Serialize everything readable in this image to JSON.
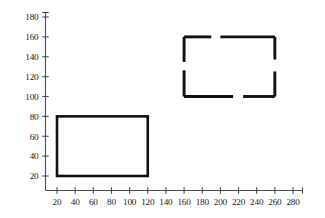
{
  "chart_data": {
    "type": "scatter",
    "title": "",
    "xlabel": "",
    "ylabel": "",
    "xlim": [
      0,
      290
    ],
    "ylim": [
      0,
      190
    ],
    "grid": false,
    "legend": null,
    "x_ticks": [
      20,
      40,
      60,
      80,
      100,
      120,
      140,
      160,
      180,
      200,
      220,
      240,
      260,
      280
    ],
    "y_ticks": [
      20,
      40,
      60,
      80,
      100,
      120,
      140,
      160,
      180
    ],
    "x_tick_labels": [
      "20",
      "40",
      "60",
      "80",
      "100",
      "120",
      "140",
      "160",
      "180",
      "200",
      "220",
      "240",
      "260",
      "280"
    ],
    "y_tick_labels": [
      "20",
      "40",
      "60",
      "80",
      "100",
      "120",
      "140",
      "160",
      "180"
    ],
    "series": [
      {
        "name": "solid-rectangle",
        "style": "solid",
        "color": "#111111",
        "shape": "rectangle",
        "x_min": 20,
        "x_max": 120,
        "y_min": 20,
        "y_max": 80,
        "width": 100,
        "height": 60,
        "corners": [
          [
            20,
            20
          ],
          [
            120,
            20
          ],
          [
            120,
            80
          ],
          [
            20,
            80
          ]
        ]
      },
      {
        "name": "dashed-rectangle",
        "style": "dashed",
        "color": "#111111",
        "shape": "rectangle",
        "x_min": 160,
        "x_max": 260,
        "y_min": 100,
        "y_max": 160,
        "width": 100,
        "height": 60,
        "corners": [
          [
            160,
            100
          ],
          [
            260,
            100
          ],
          [
            260,
            160
          ],
          [
            160,
            160
          ]
        ]
      }
    ],
    "annotations": []
  }
}
